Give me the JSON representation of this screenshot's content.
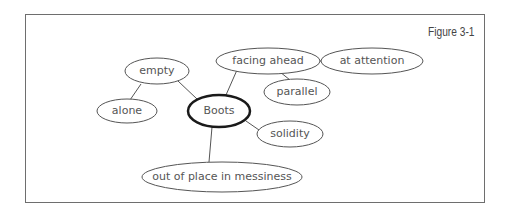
{
  "figure": {
    "label": "Figure 3-1"
  },
  "diagram": {
    "type": "cluster / mind map",
    "center": "Boots",
    "nodes": [
      {
        "id": "boots",
        "label": "Boots",
        "central": true
      },
      {
        "id": "empty",
        "label": "empty"
      },
      {
        "id": "alone",
        "label": "alone"
      },
      {
        "id": "facing_ahead",
        "label": "facing ahead"
      },
      {
        "id": "at_attention",
        "label": "at attention"
      },
      {
        "id": "parallel",
        "label": "parallel"
      },
      {
        "id": "solidity",
        "label": "solidity"
      },
      {
        "id": "messiness",
        "label": "out of place in messiness"
      }
    ],
    "edges": [
      [
        "boots",
        "empty"
      ],
      [
        "empty",
        "alone"
      ],
      [
        "boots",
        "facing_ahead"
      ],
      [
        "facing_ahead",
        "at_attention"
      ],
      [
        "facing_ahead",
        "parallel"
      ],
      [
        "boots",
        "solidity"
      ],
      [
        "boots",
        "messiness"
      ]
    ]
  }
}
